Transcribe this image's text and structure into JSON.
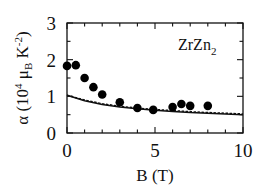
{
  "chart_data": {
    "type": "scatter",
    "title": "",
    "annotation": "ZrZn2",
    "xlabel": "B (T)",
    "ylabel": "α (10^4 μB K^-2)",
    "xlim": [
      0,
      10
    ],
    "ylim": [
      0,
      3
    ],
    "xticks": [
      0,
      5,
      10
    ],
    "yticks": [
      0,
      1,
      2,
      3
    ],
    "grid": false,
    "legend": null,
    "series": [
      {
        "name": "measured",
        "style": "filled-circle",
        "x": [
          0.0,
          0.5,
          1.0,
          1.5,
          2.0,
          3.0,
          4.0,
          4.9,
          6.0,
          6.5,
          7.0,
          8.0
        ],
        "y": [
          1.83,
          1.85,
          1.5,
          1.25,
          1.05,
          0.84,
          0.68,
          0.63,
          0.71,
          0.79,
          0.74,
          0.74
        ]
      },
      {
        "name": "theory-solid",
        "style": "solid-line",
        "x": [
          0,
          1,
          2,
          3,
          4,
          5,
          6,
          7,
          8,
          9,
          10
        ],
        "y": [
          1.03,
          0.88,
          0.78,
          0.71,
          0.66,
          0.62,
          0.59,
          0.56,
          0.54,
          0.52,
          0.5
        ]
      },
      {
        "name": "theory-dashed",
        "style": "dashed-line",
        "x": [
          0,
          1,
          2,
          3,
          4,
          5,
          6,
          7,
          8,
          9,
          10
        ],
        "y": [
          1.03,
          0.9,
          0.8,
          0.73,
          0.68,
          0.64,
          0.61,
          0.58,
          0.56,
          0.54,
          0.52
        ]
      }
    ]
  },
  "labels": {
    "x_ticks": [
      "0",
      "5",
      "10"
    ],
    "y_ticks": [
      "0",
      "1",
      "2",
      "3"
    ],
    "annotation_main": "ZrZn",
    "annotation_sub": "2",
    "xlabel": "B (T)",
    "ylabel_prefix": "α (10",
    "ylabel_exp": "4",
    "ylabel_mid": " μ",
    "ylabel_sub": "B",
    "ylabel_k": " K",
    "ylabel_kexp": "-2",
    "ylabel_close": ")"
  }
}
